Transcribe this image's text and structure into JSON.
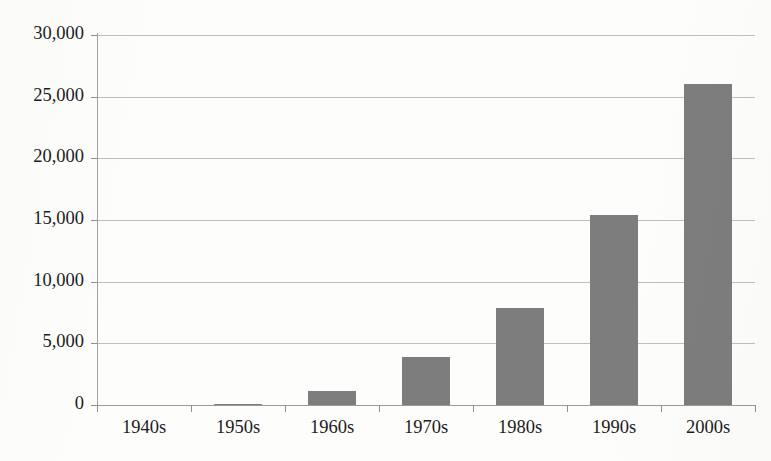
{
  "chart_data": {
    "type": "bar",
    "title": "",
    "subtitle": "",
    "xlabel": "",
    "ylabel": "",
    "categories": [
      "1940s",
      "1950s",
      "1960s",
      "1970s",
      "1980s",
      "1990s",
      "2000s"
    ],
    "values": [
      0,
      120,
      1100,
      3900,
      7900,
      15400,
      26000
    ],
    "series": [
      {
        "name": "",
        "values": [
          0,
          120,
          1100,
          3900,
          7900,
          15400,
          26000
        ]
      }
    ],
    "ylim": [
      0,
      30000
    ],
    "ytick_values": [
      0,
      5000,
      10000,
      15000,
      20000,
      25000,
      30000
    ],
    "ytick_labels": [
      "0",
      "5,000",
      "10,000",
      "15,000",
      "20,000",
      "25,000",
      "30,000"
    ],
    "grid": true,
    "legend": "none",
    "bar_color": "#7d7d7d",
    "gridline_color": "#bfbfbf",
    "axis_color": "#9f9f9f",
    "text_color": "#1c1c1c",
    "background_color": "#fdfdfc"
  }
}
